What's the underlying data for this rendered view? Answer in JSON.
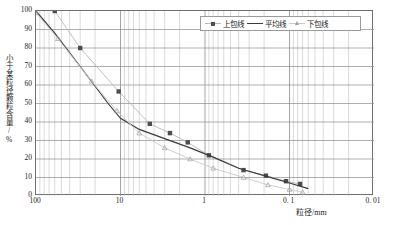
{
  "chart_data": {
    "type": "line",
    "title": "",
    "xlabel": "粒径/mm",
    "ylabel": "小于某粒径颗粒含量/%",
    "xscale": "log-reversed",
    "xlim": [
      100,
      0.01
    ],
    "ylim": [
      0,
      100
    ],
    "grid": true,
    "legend_position": "top-right",
    "xticks": [
      {
        "value": 100,
        "label": "100"
      },
      {
        "value": 10,
        "label": "10"
      },
      {
        "value": 1,
        "label": "1"
      },
      {
        "value": 0.1,
        "label": "0. 1"
      },
      {
        "value": 0.01,
        "label": "0. 01"
      }
    ],
    "yticks": [
      {
        "value": 0,
        "label": "0"
      },
      {
        "value": 10,
        "label": "10"
      },
      {
        "value": 20,
        "label": "20"
      },
      {
        "value": 30,
        "label": "30"
      },
      {
        "value": 40,
        "label": "40"
      },
      {
        "value": 50,
        "label": "50"
      },
      {
        "value": 60,
        "label": "60"
      },
      {
        "value": 70,
        "label": "70"
      },
      {
        "value": 80,
        "label": "80"
      },
      {
        "value": 90,
        "label": "90"
      },
      {
        "value": 100,
        "label": "100"
      }
    ],
    "series": [
      {
        "name": "上包线",
        "marker": "square",
        "color": "#4d4d4d",
        "line_color": "#b9b9b9",
        "points": [
          {
            "x": 60,
            "y": 100
          },
          {
            "x": 30,
            "y": 80
          },
          {
            "x": 10.5,
            "y": 56.5
          },
          {
            "x": 4.5,
            "y": 39
          },
          {
            "x": 2.6,
            "y": 34
          },
          {
            "x": 1.6,
            "y": 29
          },
          {
            "x": 0.9,
            "y": 22
          },
          {
            "x": 0.35,
            "y": 14
          },
          {
            "x": 0.19,
            "y": 11
          },
          {
            "x": 0.11,
            "y": 8
          },
          {
            "x": 0.075,
            "y": 6.5
          }
        ]
      },
      {
        "name": "平均线",
        "marker": "none",
        "color": "#3a3a3a",
        "line_color": "#3a3a3a",
        "points": [
          {
            "x": 100,
            "y": 100
          },
          {
            "x": 60,
            "y": 88
          },
          {
            "x": 30,
            "y": 70
          },
          {
            "x": 14,
            "y": 50
          },
          {
            "x": 10,
            "y": 42
          },
          {
            "x": 6,
            "y": 36
          },
          {
            "x": 3,
            "y": 31
          },
          {
            "x": 1.5,
            "y": 26
          },
          {
            "x": 0.8,
            "y": 21
          },
          {
            "x": 0.4,
            "y": 15
          },
          {
            "x": 0.2,
            "y": 11
          },
          {
            "x": 0.1,
            "y": 7
          },
          {
            "x": 0.06,
            "y": 4
          }
        ]
      },
      {
        "name": "下包线",
        "marker": "triangle",
        "color": "#9f9f9f",
        "line_color": "#c8c8c8",
        "points": [
          {
            "x": 100,
            "y": 99
          },
          {
            "x": 55,
            "y": 85
          },
          {
            "x": 22,
            "y": 62
          },
          {
            "x": 11,
            "y": 46
          },
          {
            "x": 6,
            "y": 34
          },
          {
            "x": 3,
            "y": 26
          },
          {
            "x": 1.5,
            "y": 20
          },
          {
            "x": 0.8,
            "y": 15
          },
          {
            "x": 0.35,
            "y": 10
          },
          {
            "x": 0.18,
            "y": 6
          },
          {
            "x": 0.1,
            "y": 3.5
          },
          {
            "x": 0.07,
            "y": 2
          }
        ]
      }
    ]
  },
  "legend": {
    "items": [
      {
        "label": "上包线"
      },
      {
        "label": "平均线"
      },
      {
        "label": "下包线"
      }
    ]
  },
  "axes": {
    "x_axis_title": "粒径/mm",
    "y_axis_title": "小于某粒径颗粒含量/%"
  }
}
